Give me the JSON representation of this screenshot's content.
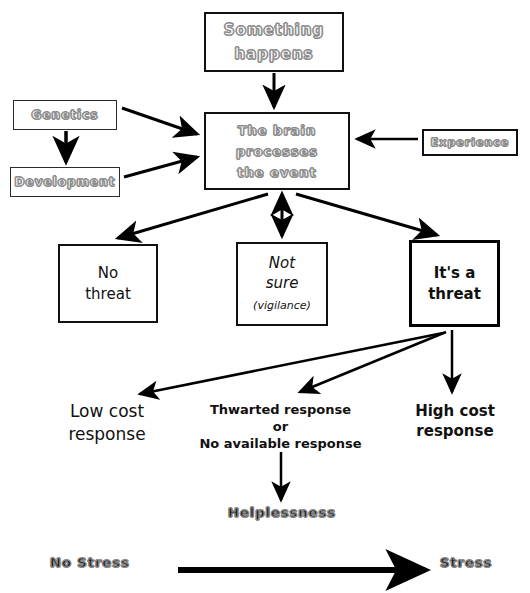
{
  "diagram": {
    "nodes": {
      "something_happens": "Something\nhappens",
      "something_happens_line1": "Something",
      "something_happens_line2": "happens",
      "genetics": "Genetics",
      "development": "Development",
      "brain_line1": "The brain",
      "brain_line2": "processes",
      "brain_line3": "the event",
      "experience": "Experience",
      "no_threat_line1": "No",
      "no_threat_line2": "threat",
      "not_sure_line1": "Not",
      "not_sure_line2": "sure",
      "not_sure_sub": "(vigilance)",
      "its_a_threat_line1": "It's a",
      "its_a_threat_line2": "threat"
    },
    "labels": {
      "low_cost_line1": "Low cost",
      "low_cost_line2": "response",
      "thwarted_line1": "Thwarted response",
      "thwarted_line2": "or",
      "thwarted_line3": "No available response",
      "high_cost_line1": "High cost",
      "high_cost_line2": "response",
      "helplessness": "Helplessness",
      "no_stress": "No Stress",
      "stress": "Stress"
    },
    "colors": {
      "outline_text": "#8a8a8a",
      "solid_text": "#111111",
      "arrow": "#000000",
      "background": "#ffffff"
    }
  }
}
